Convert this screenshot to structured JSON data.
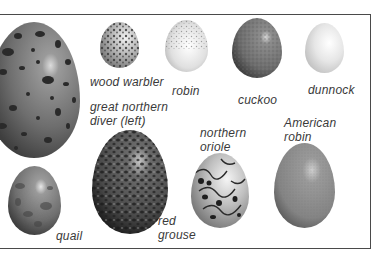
{
  "figure": {
    "style": "grayscale illustration",
    "eggs": [
      {
        "id": "great-northern-diver",
        "label": "great northern diver (left)",
        "label_lines": [
          "great northern",
          "diver (left)"
        ],
        "pattern": "large dark spots",
        "base_color": "#6e6e6e"
      },
      {
        "id": "wood-warbler",
        "label": "wood warbler",
        "label_lines": [
          "wood warbler"
        ],
        "pattern": "dense dark speckles",
        "base_color": "#b5b5b5"
      },
      {
        "id": "robin",
        "label": "robin",
        "label_lines": [
          "robin"
        ],
        "pattern": "fine speckles, pale",
        "base_color": "#d8d8d8"
      },
      {
        "id": "cuckoo",
        "label": "cuckoo",
        "label_lines": [
          "cuckoo"
        ],
        "pattern": "mottled",
        "base_color": "#7c7c7c"
      },
      {
        "id": "dunnock",
        "label": "dunnock",
        "label_lines": [
          "dunnock"
        ],
        "pattern": "plain pale",
        "base_color": "#e4e4e4"
      },
      {
        "id": "quail",
        "label": "quail",
        "label_lines": [
          "quail"
        ],
        "pattern": "mottled",
        "base_color": "#7a7a7a"
      },
      {
        "id": "red-grouse",
        "label": "red grouse",
        "label_lines": [
          "red",
          "grouse"
        ],
        "pattern": "dense dark blotches",
        "base_color": "#555555"
      },
      {
        "id": "northern-oriole",
        "label": "northern oriole",
        "label_lines": [
          "northern",
          "oriole"
        ],
        "pattern": "scrawled lines and blots",
        "base_color": "#bdbdbd"
      },
      {
        "id": "american-robin",
        "label": "American robin",
        "label_lines": [
          "American",
          "robin"
        ],
        "pattern": "plain fine texture",
        "base_color": "#8d8d8d"
      }
    ]
  }
}
